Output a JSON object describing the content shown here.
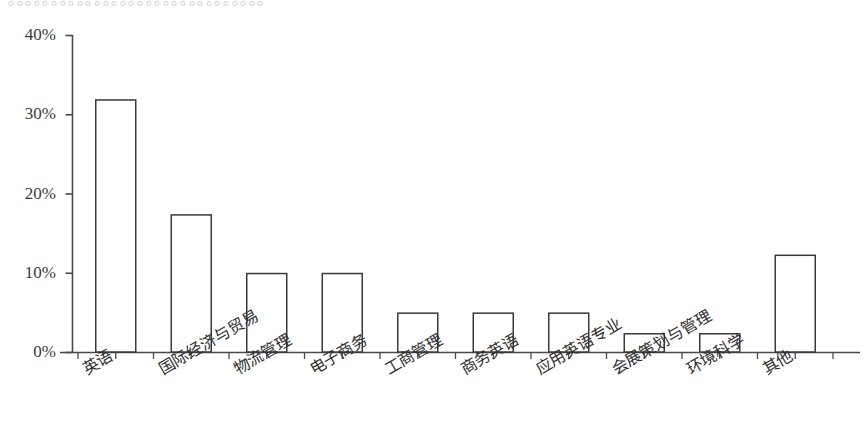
{
  "figure": {
    "clipped_header_text": "。。。。。。。。。。。。。。。。。。。。。。。。。。。。。。"
  },
  "chart_data": {
    "type": "bar",
    "title": "",
    "xlabel": "",
    "ylabel": "",
    "ylim": [
      0,
      40
    ],
    "yticks": [
      0,
      10,
      20,
      30,
      40
    ],
    "ytick_labels": [
      "0%",
      "10%",
      "20%",
      "30%",
      "40%"
    ],
    "grid": false,
    "legend": null,
    "bar_style": {
      "fill": "#ffffff",
      "edge": "#3a3a3a",
      "edge_width_px": 1.5
    },
    "axis_color": "#4a4a4a",
    "categories": [
      "英语",
      "国际经济与贸易",
      "物流管理",
      "电子商务",
      "工商管理",
      "商务英语",
      "应用英语专业",
      "会展策划与管理",
      "环境科学",
      "其他"
    ],
    "values": [
      31.8,
      17.3,
      9.9,
      9.9,
      4.9,
      4.9,
      4.9,
      2.3,
      2.3,
      12.2
    ],
    "value_labels": [
      "",
      "",
      "",
      "",
      "",
      "",
      "",
      "",
      "",
      ""
    ]
  }
}
